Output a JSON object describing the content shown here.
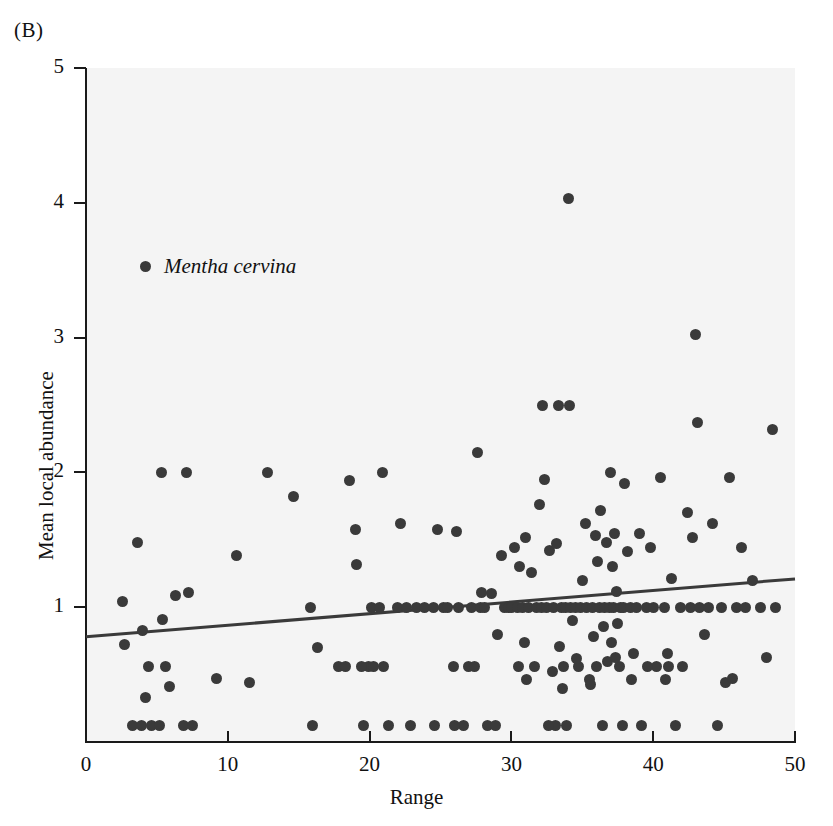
{
  "panel": {
    "label": "(B)"
  },
  "chart_data": {
    "type": "scatter",
    "title": "",
    "xlabel": "Range",
    "ylabel": "Mean local abundance",
    "xlim": [
      0,
      50
    ],
    "ylim": [
      0,
      5
    ],
    "xticks": [
      0,
      10,
      20,
      30,
      40,
      50
    ],
    "yticks": [
      1,
      2,
      3,
      4,
      5
    ],
    "grid": false,
    "legend_position": "upper-left-inside",
    "series": [
      {
        "name": "Mentha cervina",
        "marker": "filled-circle",
        "color": "#3a3a3a",
        "points": [
          [
            2.6,
            1.04
          ],
          [
            2.7,
            0.72
          ],
          [
            3.3,
            0.12
          ],
          [
            3.6,
            1.48
          ],
          [
            3.9,
            0.12
          ],
          [
            4.0,
            0.83
          ],
          [
            4.2,
            0.33
          ],
          [
            4.4,
            0.56
          ],
          [
            4.6,
            0.12
          ],
          [
            5.2,
            0.12
          ],
          [
            5.3,
            2.0
          ],
          [
            5.4,
            0.91
          ],
          [
            5.6,
            0.56
          ],
          [
            5.9,
            0.41
          ],
          [
            6.3,
            1.09
          ],
          [
            6.9,
            0.12
          ],
          [
            7.1,
            2.0
          ],
          [
            7.2,
            1.11
          ],
          [
            7.5,
            0.12
          ],
          [
            9.2,
            0.47
          ],
          [
            10.6,
            1.38
          ],
          [
            11.5,
            0.44
          ],
          [
            12.8,
            2.0
          ],
          [
            14.6,
            1.82
          ],
          [
            15.8,
            1.0
          ],
          [
            16.0,
            0.12
          ],
          [
            16.3,
            0.7
          ],
          [
            17.8,
            0.56
          ],
          [
            18.3,
            0.56
          ],
          [
            18.6,
            1.94
          ],
          [
            19.0,
            1.58
          ],
          [
            19.1,
            1.32
          ],
          [
            19.6,
            0.12
          ],
          [
            19.9,
            0.56
          ],
          [
            20.1,
            1.0
          ],
          [
            20.7,
            1.0
          ],
          [
            20.9,
            2.0
          ],
          [
            21.0,
            0.56
          ],
          [
            21.3,
            0.12
          ],
          [
            22.0,
            1.0
          ],
          [
            22.2,
            1.62
          ],
          [
            22.6,
            1.0
          ],
          [
            23.3,
            1.0
          ],
          [
            23.9,
            1.0
          ],
          [
            24.5,
            1.0
          ],
          [
            24.6,
            0.12
          ],
          [
            24.8,
            1.58
          ],
          [
            25.2,
            1.0
          ],
          [
            25.5,
            1.0
          ],
          [
            25.9,
            0.56
          ],
          [
            26.1,
            1.56
          ],
          [
            26.3,
            1.0
          ],
          [
            26.6,
            0.12
          ],
          [
            27.0,
            0.56
          ],
          [
            27.2,
            1.0
          ],
          [
            27.4,
            0.56
          ],
          [
            27.6,
            2.15
          ],
          [
            27.8,
            1.0
          ],
          [
            27.9,
            1.11
          ],
          [
            28.1,
            1.0
          ],
          [
            28.3,
            0.12
          ],
          [
            28.6,
            1.1
          ],
          [
            29.0,
            0.8
          ],
          [
            29.3,
            1.38
          ],
          [
            29.5,
            1.0
          ],
          [
            29.8,
            1.0
          ],
          [
            30.0,
            1.0
          ],
          [
            30.2,
            1.44
          ],
          [
            30.4,
            1.0
          ],
          [
            30.6,
            1.3
          ],
          [
            30.8,
            1.0
          ],
          [
            31.0,
            1.52
          ],
          [
            31.2,
            1.0
          ],
          [
            31.4,
            1.26
          ],
          [
            31.6,
            0.56
          ],
          [
            31.8,
            1.0
          ],
          [
            32.0,
            1.76
          ],
          [
            32.1,
            1.0
          ],
          [
            32.2,
            2.5
          ],
          [
            32.3,
            1.95
          ],
          [
            32.5,
            1.0
          ],
          [
            32.7,
            1.42
          ],
          [
            32.9,
            0.52
          ],
          [
            33.0,
            1.0
          ],
          [
            33.1,
            0.12
          ],
          [
            33.2,
            1.47
          ],
          [
            33.3,
            2.5
          ],
          [
            33.4,
            0.71
          ],
          [
            33.5,
            1.0
          ],
          [
            33.6,
            0.4
          ],
          [
            33.8,
            1.0
          ],
          [
            33.9,
            0.12
          ],
          [
            34.0,
            4.03
          ],
          [
            34.1,
            2.5
          ],
          [
            34.2,
            1.0
          ],
          [
            34.3,
            0.9
          ],
          [
            34.5,
            1.0
          ],
          [
            34.7,
            0.56
          ],
          [
            34.9,
            1.0
          ],
          [
            35.0,
            1.2
          ],
          [
            35.2,
            1.62
          ],
          [
            35.3,
            1.0
          ],
          [
            35.5,
            0.46
          ],
          [
            35.7,
            1.0
          ],
          [
            35.9,
            1.53
          ],
          [
            36.0,
            0.56
          ],
          [
            36.1,
            1.34
          ],
          [
            36.2,
            1.0
          ],
          [
            36.3,
            1.72
          ],
          [
            36.5,
            0.86
          ],
          [
            36.6,
            1.0
          ],
          [
            36.7,
            1.48
          ],
          [
            36.8,
            0.6
          ],
          [
            36.9,
            1.0
          ],
          [
            37.0,
            2.0
          ],
          [
            37.1,
            1.3
          ],
          [
            37.2,
            1.0
          ],
          [
            37.3,
            1.55
          ],
          [
            37.4,
            1.12
          ],
          [
            37.5,
            0.88
          ],
          [
            37.6,
            0.56
          ],
          [
            37.7,
            1.0
          ],
          [
            37.8,
            0.12
          ],
          [
            37.9,
            1.0
          ],
          [
            38.0,
            1.92
          ],
          [
            38.2,
            1.41
          ],
          [
            38.4,
            1.0
          ],
          [
            38.6,
            0.66
          ],
          [
            38.8,
            1.0
          ],
          [
            39.0,
            1.55
          ],
          [
            39.2,
            0.12
          ],
          [
            39.5,
            1.0
          ],
          [
            39.8,
            1.44
          ],
          [
            40.0,
            1.0
          ],
          [
            40.2,
            0.56
          ],
          [
            40.5,
            1.96
          ],
          [
            40.8,
            1.0
          ],
          [
            41.0,
            0.66
          ],
          [
            41.3,
            1.21
          ],
          [
            41.6,
            0.12
          ],
          [
            41.9,
            1.0
          ],
          [
            42.1,
            0.56
          ],
          [
            42.4,
            1.7
          ],
          [
            42.6,
            1.0
          ],
          [
            42.8,
            1.52
          ],
          [
            43.0,
            3.02
          ],
          [
            43.1,
            2.37
          ],
          [
            43.3,
            1.0
          ],
          [
            43.6,
            0.8
          ],
          [
            43.9,
            1.0
          ],
          [
            44.2,
            1.62
          ],
          [
            44.5,
            0.12
          ],
          [
            44.8,
            1.0
          ],
          [
            45.1,
            0.44
          ],
          [
            45.4,
            1.96
          ],
          [
            45.6,
            0.47
          ],
          [
            45.9,
            1.0
          ],
          [
            46.2,
            1.44
          ],
          [
            46.5,
            1.0
          ],
          [
            47.0,
            1.2
          ],
          [
            47.6,
            1.0
          ],
          [
            48.0,
            0.63
          ],
          [
            48.4,
            2.32
          ],
          [
            48.6,
            1.0
          ],
          [
            30.5,
            0.56
          ],
          [
            31.1,
            0.46
          ],
          [
            32.6,
            0.12
          ],
          [
            33.7,
            0.56
          ],
          [
            35.6,
            0.43
          ],
          [
            36.4,
            0.12
          ],
          [
            38.5,
            0.46
          ],
          [
            39.6,
            0.56
          ],
          [
            41.1,
            0.56
          ],
          [
            28.9,
            0.12
          ],
          [
            22.9,
            0.12
          ],
          [
            26.0,
            0.12
          ],
          [
            19.4,
            0.56
          ],
          [
            20.3,
            0.56
          ],
          [
            30.9,
            0.74
          ],
          [
            34.6,
            0.62
          ],
          [
            35.8,
            0.78
          ],
          [
            37.05,
            0.74
          ],
          [
            37.35,
            0.63
          ],
          [
            40.9,
            0.46
          ]
        ]
      }
    ],
    "trendline": {
      "name": "linear-fit",
      "color": "#3a3a3a",
      "x_start": 0,
      "y_start": 0.78,
      "x_end": 50,
      "y_end": 1.21
    }
  }
}
